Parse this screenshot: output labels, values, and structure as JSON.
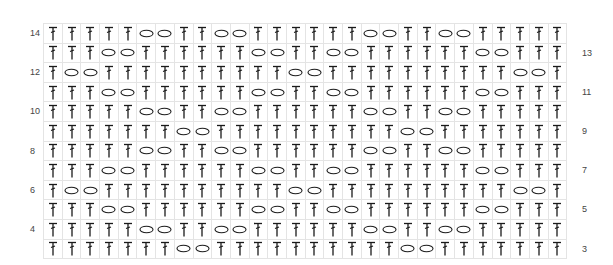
{
  "chart": {
    "columns": 28,
    "symbols": {
      "T": "treble-crochet-icon",
      "O": "chain-stitch-icon"
    },
    "grid_color": "#e4e4e4",
    "symbol_color": "#1a1a1a",
    "rows": [
      {
        "number": "14",
        "label_side": "left",
        "pattern": "TTTTTOOTTOOTTTTTTOOTTOOTTTTT"
      },
      {
        "number": "13",
        "label_side": "right",
        "pattern": "TTTOOTTTTTTOOTTOOTTTTTTOOTTT"
      },
      {
        "number": "12",
        "label_side": "left",
        "pattern": "TOOTTTTTTTTTTOOTTTTTTTTTTOOT"
      },
      {
        "number": "11",
        "label_side": "right",
        "pattern": "TTTOOTTTTTTOOTTOOTTTTTTOOTTT"
      },
      {
        "number": "10",
        "label_side": "left",
        "pattern": "TTTTTOOTTOOTTTTTTOOTTOOTTTTT"
      },
      {
        "number": "9",
        "label_side": "right",
        "pattern": "TTTTTTTOOTTTTTTTTTTOOTTTTTTT"
      },
      {
        "number": "8",
        "label_side": "left",
        "pattern": "TTTTTOOTTOOTTTTTTOOTTOOTTTTT"
      },
      {
        "number": "7",
        "label_side": "right",
        "pattern": "TTTOOTTTTTTOOTTOOTTTTTTOOTTT"
      },
      {
        "number": "6",
        "label_side": "left",
        "pattern": "TOOTTTTTTTTTTOOTTTTTTTTTTOOT"
      },
      {
        "number": "5",
        "label_side": "right",
        "pattern": "TTTOOTTTTTTOOTTOOTTTTTTOOTTT"
      },
      {
        "number": "4",
        "label_side": "left",
        "pattern": "TTTTTOOTTOOTTTTTTOOTTOOTTTTT"
      },
      {
        "number": "3",
        "label_side": "right",
        "pattern": "TTTTTTTOOTTTTTTTTTTOOTTTTTTT"
      }
    ]
  }
}
